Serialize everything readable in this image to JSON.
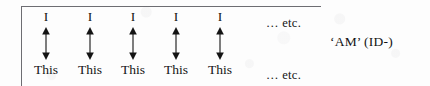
{
  "figure": {
    "type": "linguistic-correspondence-diagram",
    "frame": {
      "visible_borders": "top-and-left",
      "border_color": "#6d6d72"
    },
    "background_color": "#fdfdfd",
    "ink_color": "#141414",
    "columns": [
      {
        "top": "I",
        "bottom": "This",
        "arrow": "double-headed-vertical-arrow"
      },
      {
        "top": "I",
        "bottom": "This",
        "arrow": "double-headed-vertical-arrow"
      },
      {
        "top": "I",
        "bottom": "This",
        "arrow": "double-headed-vertical-arrow"
      },
      {
        "top": "I",
        "bottom": "This",
        "arrow": "double-headed-vertical-arrow"
      },
      {
        "top": "I",
        "bottom": "This",
        "arrow": "double-headed-vertical-arrow"
      }
    ],
    "ellipsis_top": "… etc.",
    "ellipsis_bottom": "… etc.",
    "side_label": "‘AM’ (ID-)"
  }
}
